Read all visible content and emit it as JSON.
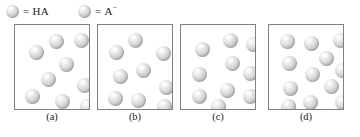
{
  "figure": {
    "background_color": "#ffffff",
    "sphere_color": "#d0d0d0",
    "box_border_color": "#808080"
  },
  "legend": {
    "entries": [
      {
        "icon": "sphere-icon",
        "equals": "=",
        "label": "HA",
        "charge": ""
      },
      {
        "icon": "sphere-icon",
        "equals": "=",
        "label": "A",
        "charge": "−"
      }
    ]
  },
  "chart_data": {
    "type": "scatter",
    "xlabel": "",
    "ylabel": "",
    "legend": [
      "= HA",
      "= A−"
    ],
    "panels": [
      {
        "label": "(a)",
        "count": 9,
        "particles": [
          {
            "x": 34,
            "y": 9,
            "r": 7.5
          },
          {
            "x": 59,
            "y": 8,
            "r": 7.5
          },
          {
            "x": 14,
            "y": 20,
            "r": 7.5
          },
          {
            "x": 44,
            "y": 32,
            "r": 7.5
          },
          {
            "x": 26,
            "y": 47,
            "r": 7.5
          },
          {
            "x": 62,
            "y": 53,
            "r": 7.5
          },
          {
            "x": 10,
            "y": 64,
            "r": 7.5
          },
          {
            "x": 40,
            "y": 69,
            "r": 7.5
          },
          {
            "x": 65,
            "y": 74,
            "r": 7.5
          }
        ]
      },
      {
        "label": "(b)",
        "count": 9,
        "particles": [
          {
            "x": 30,
            "y": 8,
            "r": 7.5
          },
          {
            "x": 11,
            "y": 20,
            "r": 7.5
          },
          {
            "x": 58,
            "y": 21,
            "r": 7.5
          },
          {
            "x": 38,
            "y": 38,
            "r": 7.5
          },
          {
            "x": 15,
            "y": 44,
            "r": 7.5
          },
          {
            "x": 61,
            "y": 55,
            "r": 7.5
          },
          {
            "x": 10,
            "y": 66,
            "r": 7.5
          },
          {
            "x": 33,
            "y": 68,
            "r": 7.5
          },
          {
            "x": 59,
            "y": 74,
            "r": 7.5
          }
        ]
      },
      {
        "label": "(c)",
        "count": 10,
        "particles": [
          {
            "x": 42,
            "y": 8,
            "r": 7.5
          },
          {
            "x": 65,
            "y": 12,
            "r": 7.5
          },
          {
            "x": 14,
            "y": 17,
            "r": 7.5
          },
          {
            "x": 44,
            "y": 31,
            "r": 7.5
          },
          {
            "x": 11,
            "y": 42,
            "r": 7.5
          },
          {
            "x": 62,
            "y": 41,
            "r": 7.5
          },
          {
            "x": 39,
            "y": 58,
            "r": 7.5
          },
          {
            "x": 11,
            "y": 64,
            "r": 7.5
          },
          {
            "x": 62,
            "y": 64,
            "r": 7.5
          },
          {
            "x": 30,
            "y": 74,
            "r": 7.5
          }
        ]
      },
      {
        "label": "(d)",
        "count": 12,
        "particles": [
          {
            "x": 11,
            "y": 9,
            "r": 7.5
          },
          {
            "x": 35,
            "y": 11,
            "r": 7.5
          },
          {
            "x": 64,
            "y": 8,
            "r": 7.5
          },
          {
            "x": 50,
            "y": 26,
            "r": 7.5
          },
          {
            "x": 13,
            "y": 31,
            "r": 7.5
          },
          {
            "x": 36,
            "y": 42,
            "r": 7.5
          },
          {
            "x": 66,
            "y": 38,
            "r": 7.5
          },
          {
            "x": 55,
            "y": 54,
            "r": 7.5
          },
          {
            "x": 14,
            "y": 56,
            "r": 7.5
          },
          {
            "x": 34,
            "y": 70,
            "r": 7.5
          },
          {
            "x": 66,
            "y": 70,
            "r": 7.5
          },
          {
            "x": 12,
            "y": 74,
            "r": 7.5
          }
        ]
      }
    ]
  }
}
